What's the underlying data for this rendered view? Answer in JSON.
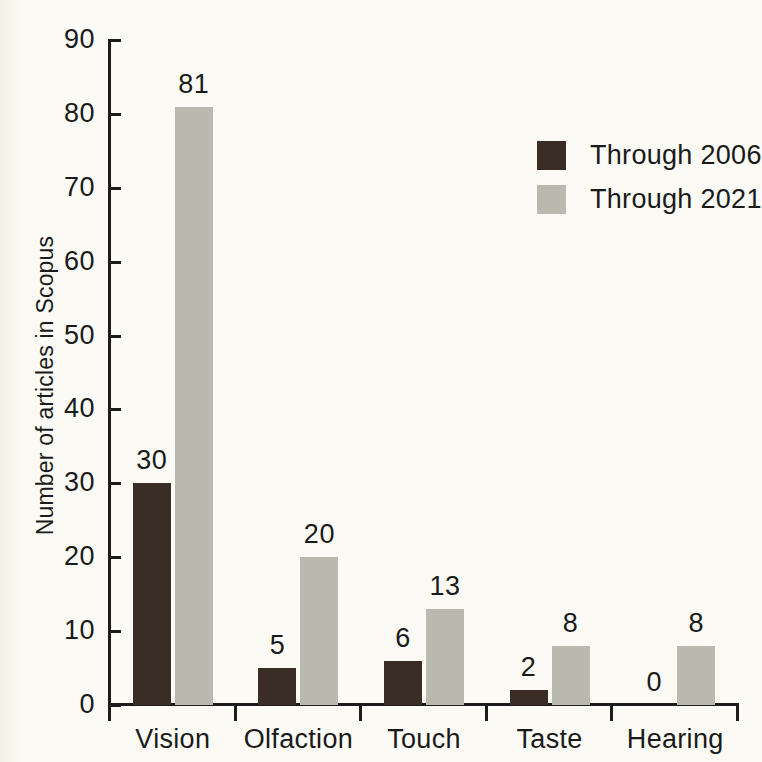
{
  "chart_data": {
    "type": "bar",
    "title": "",
    "xlabel": "",
    "ylabel": "Number of articles in Scopus",
    "categories": [
      "Vision",
      "Olfaction",
      "Touch",
      "Taste",
      "Hearing"
    ],
    "series": [
      {
        "name": "Through 2006",
        "color": "#3a2d26",
        "values": [
          30,
          5,
          6,
          2,
          0
        ]
      },
      {
        "name": "Through 2021",
        "color": "#b9b9b0",
        "values": [
          81,
          20,
          13,
          8,
          8
        ]
      }
    ],
    "ylim": [
      0,
      90
    ],
    "yticks": [
      0,
      10,
      20,
      30,
      40,
      50,
      60,
      70,
      80,
      90
    ],
    "ytick_labels": [
      "0",
      "10",
      "20",
      "30",
      "40",
      "50",
      "60",
      "70",
      "80",
      "90"
    ],
    "grid": false,
    "legend_position": "upper-right",
    "data_labels": [
      [
        "30",
        "5",
        "6",
        "2",
        "0"
      ],
      [
        "81",
        "20",
        "13",
        "8",
        "8"
      ]
    ],
    "background_color": "#fbfaf4",
    "axis_color": "#1c1c1c"
  },
  "legend": {
    "entries": [
      {
        "label": "Through 2006"
      },
      {
        "label": "Through 2021"
      }
    ]
  }
}
